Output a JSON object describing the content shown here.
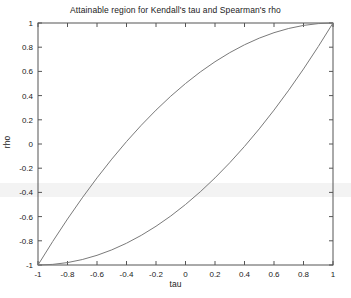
{
  "chart_data": {
    "type": "line",
    "title": "Attainable region for Kendall's tau and Spearman's rho",
    "xlabel": "tau",
    "ylabel": "rho",
    "xlim": [
      -1,
      1
    ],
    "ylim": [
      -1,
      1
    ],
    "grid": false,
    "legend": "none",
    "xticks": [
      "-1",
      "-0.8",
      "-0.6",
      "-0.4",
      "-0.2",
      "0",
      "0.2",
      "0.4",
      "0.6",
      "0.8",
      "1"
    ],
    "xtick_values": [
      -1,
      -0.8,
      -0.6,
      -0.4,
      -0.2,
      0,
      0.2,
      0.4,
      0.6,
      0.8,
      1
    ],
    "yticks": [
      "1",
      "0.8",
      "0.6",
      "0.4",
      "0.2",
      "0",
      "-0.2",
      "-0.4",
      "-0.6",
      "-0.8",
      "-1"
    ],
    "ytick_values": [
      1,
      0.8,
      0.6,
      0.4,
      0.2,
      0,
      -0.2,
      -0.4,
      -0.6,
      -0.8,
      -1
    ],
    "x": [
      -1,
      -0.9,
      -0.8,
      -0.7,
      -0.6,
      -0.5,
      -0.4,
      -0.3,
      -0.2,
      -0.1,
      0,
      0.1,
      0.2,
      0.3,
      0.4,
      0.5,
      0.6,
      0.7,
      0.8,
      0.9,
      1
    ],
    "series": [
      {
        "name": "upper bound",
        "formula": "rho = (1 + 2*tau - tau^2) / 2",
        "values": [
          -1,
          -0.805,
          -0.62,
          -0.445,
          -0.28,
          -0.125,
          0.02,
          0.155,
          0.28,
          0.395,
          0.5,
          0.595,
          0.68,
          0.755,
          0.82,
          0.875,
          0.92,
          0.955,
          0.98,
          0.995,
          1
        ]
      },
      {
        "name": "lower bound",
        "formula": "rho = (-1 + 2*tau + tau^2) / 2",
        "values": [
          -1,
          -0.995,
          -0.98,
          -0.955,
          -0.92,
          -0.875,
          -0.82,
          -0.755,
          -0.68,
          -0.595,
          -0.5,
          -0.395,
          -0.28,
          -0.155,
          -0.02,
          0.125,
          0.28,
          0.445,
          0.62,
          0.805,
          1
        ]
      }
    ],
    "colors": {
      "line": "#7a7a7a",
      "axis": "#555555",
      "background": "#ffffff"
    }
  }
}
